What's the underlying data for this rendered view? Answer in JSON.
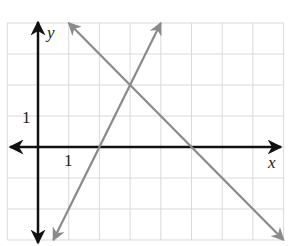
{
  "chart_data": {
    "type": "line",
    "title": "",
    "xlabel": "x",
    "ylabel": "y",
    "xlim": [
      -1,
      8
    ],
    "ylim": [
      -3,
      4
    ],
    "grid": true,
    "tick_labels": {
      "x": [
        "1"
      ],
      "y": [
        "1"
      ]
    },
    "series": [
      {
        "name": "line-increasing",
        "equation": "y = 2x - 4",
        "x": [
          0.5,
          4
        ],
        "y": [
          -3,
          4
        ],
        "color": "#8a8a8a",
        "arrows": "both"
      },
      {
        "name": "line-decreasing",
        "equation": "y = -x + 5",
        "x": [
          1,
          8
        ],
        "y": [
          4,
          -3
        ],
        "color": "#8a8a8a",
        "arrows": "both"
      }
    ],
    "intersection": {
      "x": 3,
      "y": 2
    }
  },
  "axes": {
    "x_label": "x",
    "y_label": "y",
    "x_tick": "1",
    "y_tick": "1"
  },
  "colors": {
    "axis": "#111111",
    "grid": "#d9d9d9",
    "lines": "#8a8a8a"
  }
}
